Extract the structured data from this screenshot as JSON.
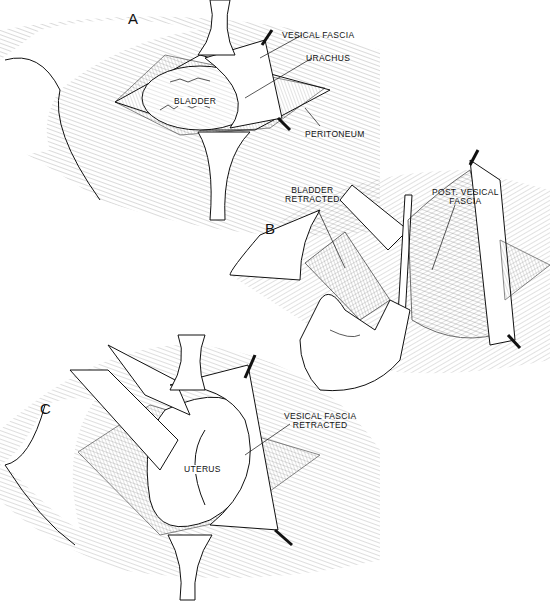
{
  "figure": {
    "panels": [
      {
        "id": "A",
        "letter": "A",
        "labels": [
          "VESICAL FASCIA",
          "URACHUS",
          "BLADDER",
          "PERITONEUM"
        ]
      },
      {
        "id": "B",
        "letter": "B",
        "labels": [
          "BLADDER RETRACTED",
          "POST. VESICAL FASCIA"
        ],
        "label_lines": {
          "bladder_retracted": [
            "BLADDER",
            "RETRACTED"
          ],
          "post_vesical_fascia": [
            "POST. VESICAL",
            "FASCIA"
          ]
        }
      },
      {
        "id": "C",
        "letter": "C",
        "labels": [
          "VESICAL FASCIA RETRACTED",
          "UTERUS"
        ],
        "label_lines": {
          "vesical_fascia_retracted": [
            "VESICAL FASCIA",
            "RETRACTED"
          ]
        }
      }
    ]
  },
  "colors": {
    "ink": "#111111",
    "background": "#ffffff"
  }
}
